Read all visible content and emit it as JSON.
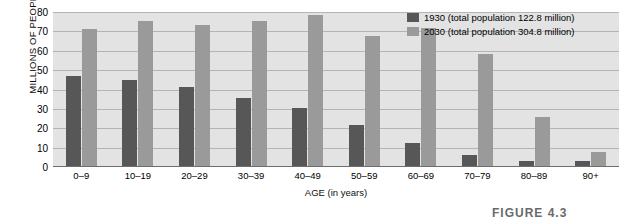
{
  "chart_data": {
    "type": "bar",
    "title": "",
    "subtitle": "",
    "xlabel": "AGE (in years)",
    "ylabel": "MILLIONS OF PEOPLE",
    "categories": [
      "0–9",
      "10–19",
      "20–29",
      "30–39",
      "40–49",
      "50–59",
      "60–69",
      "70–79",
      "80–89",
      "90+"
    ],
    "series": [
      {
        "name": "1930 (total population 122.8 million)",
        "short_name": "1930",
        "color": "#575757",
        "values": [
          47,
          45,
          41.5,
          35.5,
          30.5,
          21.5,
          12.5,
          6,
          3,
          3
        ]
      },
      {
        "name": "2030 (total population 304.8 million)",
        "short_name": "2030",
        "color": "#9a9a9a",
        "values": [
          71,
          75.5,
          73.5,
          75.5,
          78.5,
          67.5,
          72,
          58.5,
          26,
          8
        ]
      }
    ],
    "ylim": [
      0,
      80
    ],
    "yticks": [
      0,
      10,
      20,
      30,
      40,
      50,
      60,
      70,
      80
    ],
    "grid": true,
    "legend_position": "top-right",
    "plot_background": "#e3e3e3",
    "gridline_color": "#8e8e8e"
  },
  "legend": {
    "entries": [
      {
        "label": "1930 (total population 122.8 million)"
      },
      {
        "label": "2030 (total population 304.8 million)"
      }
    ]
  },
  "caption": {
    "text": "FIGURE 4.3"
  }
}
